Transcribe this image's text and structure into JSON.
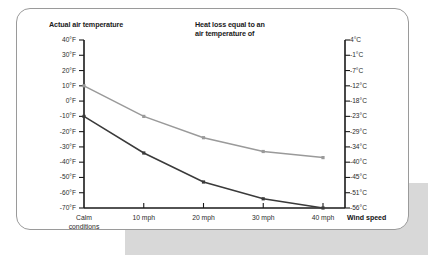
{
  "headers": {
    "left_title": "Actual air temperature",
    "right_title_line1": "Heat loss equal to an",
    "right_title_line2": "air temperature of"
  },
  "axis": {
    "x_title": "Wind speed",
    "x_labels": [
      "Calm",
      "conditions",
      "10 mph",
      "20 mph",
      "30 mph",
      "40 mph"
    ],
    "y_left_ticks": [
      "40°F",
      "30°F",
      "20°F",
      "10°F",
      "0°F",
      "-10°F",
      "-20°F",
      "-30°F",
      "-40°F",
      "-50°F",
      "-60°F",
      "-70°F"
    ],
    "y_right_ticks": [
      "4°C",
      "-1°C",
      "-7°C",
      "-12°C",
      "-18°C",
      "-23°C",
      "-29°C",
      "-34°C",
      "-40°C",
      "-45°C",
      "-51°C",
      "-56°C"
    ]
  },
  "colors": {
    "line_light": "#9a9a9a",
    "line_dark": "#3a3a3a",
    "axis": "#1a1a1a",
    "card_border": "#9a9a9a",
    "band": "#d8d8d8"
  },
  "chart_data": {
    "type": "line",
    "title": "Actual air temperature",
    "xlabel": "Wind speed",
    "ylabel": "Actual air temperature",
    "categories": [
      "Calm conditions",
      "10 mph",
      "20 mph",
      "30 mph",
      "40 mph"
    ],
    "series": [
      {
        "name": "Actual air temperature 10°F",
        "color": "#9a9a9a",
        "values": [
          10,
          -10,
          -24,
          -33,
          -37
        ]
      },
      {
        "name": "Actual air temperature -10°F",
        "color": "#3a3a3a",
        "values": [
          -10,
          -34,
          -53,
          -64,
          -70
        ]
      }
    ],
    "ylim": [
      -70,
      40
    ],
    "y_tick_step": 10,
    "y_left_unit": "°F",
    "y_right_unit": "°C",
    "y_right_values": [
      4,
      -1,
      -7,
      -12,
      -18,
      -23,
      -29,
      -34,
      -40,
      -45,
      -51,
      -56
    ],
    "grid": false,
    "legend": "none",
    "annotations": [
      "Heat loss equal to an air temperature of"
    ]
  }
}
